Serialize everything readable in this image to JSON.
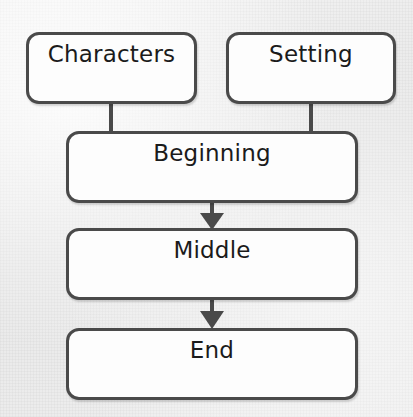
{
  "diagram": {
    "background_color": "#eeeeee",
    "box_fill_color": "#fdfdfd",
    "box_border_color": "#4a4a4a",
    "text_color": "#1b1b1b",
    "connector_color": "#4a4a4a"
  },
  "nodes": [
    {
      "id": "characters",
      "label": "Characters",
      "row": "top",
      "column": "left"
    },
    {
      "id": "setting",
      "label": "Setting",
      "row": "top",
      "column": "right"
    },
    {
      "id": "beginning",
      "label": "Beginning",
      "row": "second",
      "column": "full"
    },
    {
      "id": "middle",
      "label": "Middle",
      "row": "third",
      "column": "full"
    },
    {
      "id": "end",
      "label": "End",
      "row": "fourth",
      "column": "full"
    }
  ],
  "connectors": [
    {
      "from": "characters",
      "to": "beginning",
      "style": "plain-line",
      "arrowhead": false
    },
    {
      "from": "setting",
      "to": "beginning",
      "style": "plain-line",
      "arrowhead": false
    },
    {
      "from": "beginning",
      "to": "middle",
      "style": "arrow",
      "arrowhead": true
    },
    {
      "from": "middle",
      "to": "end",
      "style": "arrow",
      "arrowhead": true
    }
  ]
}
